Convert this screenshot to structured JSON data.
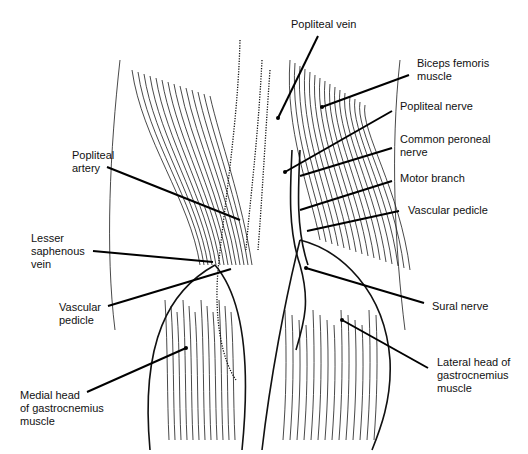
{
  "figure": {
    "colors": {
      "ink": "#111111",
      "background": "#ffffff"
    }
  },
  "labels": [
    {
      "id": "popliteal-vein",
      "text": "Popliteal vein",
      "side": "top"
    },
    {
      "id": "biceps-femoris-muscle",
      "text": "Biceps femoris\nmuscle",
      "side": "right"
    },
    {
      "id": "popliteal-nerve",
      "text": "Popliteal nerve",
      "side": "right"
    },
    {
      "id": "common-peroneal-nerve",
      "text": "Common peroneal\nnerve",
      "side": "right"
    },
    {
      "id": "motor-branch",
      "text": "Motor branch",
      "side": "right"
    },
    {
      "id": "vascular-pedicle-right",
      "text": "Vascular pedicle",
      "side": "right"
    },
    {
      "id": "sural-nerve",
      "text": "Sural nerve",
      "side": "right"
    },
    {
      "id": "lateral-head-gastrocnemius",
      "text": "Lateral head of\ngastrocnemius\nmuscle",
      "side": "right"
    },
    {
      "id": "popliteal-artery",
      "text": "Popliteal\nartery",
      "side": "left"
    },
    {
      "id": "lesser-saphenous-vein",
      "text": "Lesser\nsaphenous\nvein",
      "side": "left"
    },
    {
      "id": "vascular-pedicle-left",
      "text": "Vascular\npedicle",
      "side": "left"
    },
    {
      "id": "medial-head-gastrocnemius",
      "text": "Medial head\nof gastrocnemius\nmuscle",
      "side": "left"
    }
  ]
}
